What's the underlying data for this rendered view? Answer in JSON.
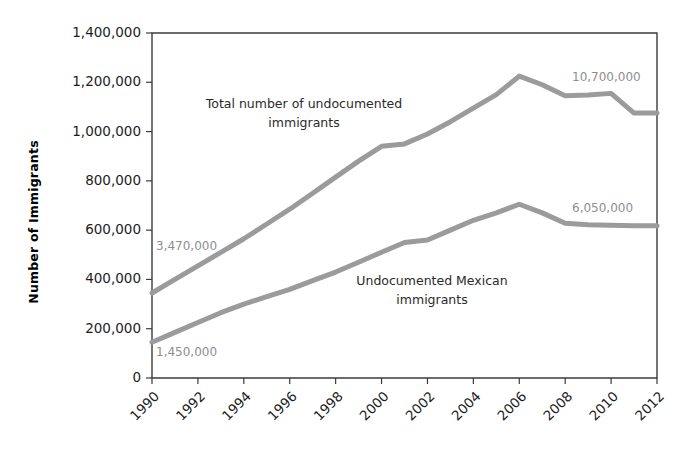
{
  "chart_data": {
    "type": "line",
    "title": "",
    "xlabel": "",
    "ylabel": "Number of Immigrants",
    "xlim": [
      1990,
      2012
    ],
    "ylim": [
      0,
      1400000
    ],
    "grid": false,
    "legend_position": "inline-labels",
    "x": [
      1990,
      1991,
      1992,
      1993,
      1994,
      1995,
      1996,
      1997,
      1998,
      1999,
      2000,
      2001,
      2002,
      2003,
      2004,
      2005,
      2006,
      2007,
      2008,
      2009,
      2010,
      2011,
      2012
    ],
    "xticks": [
      "1990",
      "1992",
      "1994",
      "1996",
      "1998",
      "2000",
      "2002",
      "2004",
      "2006",
      "2008",
      "2010",
      "2012"
    ],
    "yticks": [
      "0",
      "200,000",
      "400,000",
      "600,000",
      "800,000",
      "1,000,000",
      "1,200,000",
      "1,400,000"
    ],
    "ytick_values": [
      0,
      200000,
      400000,
      600000,
      800000,
      1000000,
      1200000,
      1400000
    ],
    "series": [
      {
        "name": "Total number of undocumented immigrants",
        "label_line1": "Total number of undocumented",
        "label_line2": "immigrants",
        "color": "#9b9b9b",
        "values": [
          345000,
          400000,
          455000,
          510000,
          565000,
          625000,
          685000,
          750000,
          815000,
          880000,
          940000,
          950000,
          990000,
          1040000,
          1095000,
          1150000,
          1225000,
          1190000,
          1145000,
          1148000,
          1155000,
          1075000,
          1075000
        ],
        "start_annotation": "3,470,000",
        "end_annotation": "10,700,000"
      },
      {
        "name": "Undocumented Mexican immigrants",
        "label_line1": "Undocumented Mexican",
        "label_line2": "immigrants",
        "color": "#9b9b9b",
        "values": [
          145000,
          185000,
          225000,
          265000,
          300000,
          330000,
          360000,
          395000,
          430000,
          470000,
          510000,
          550000,
          560000,
          600000,
          640000,
          670000,
          705000,
          670000,
          628000,
          622000,
          620000,
          618000,
          618000
        ],
        "start_annotation": "1,450,000",
        "end_annotation": "6,050,000"
      }
    ]
  }
}
